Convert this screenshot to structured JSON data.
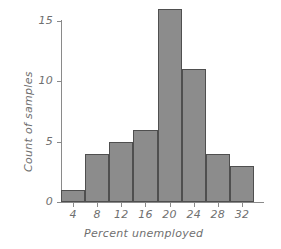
{
  "chart_data": {
    "type": "bar",
    "title": "",
    "subtitle": "",
    "xlabel": "Percent unemployed",
    "ylabel": "Count of samples",
    "categories": [
      "2-6",
      "6-10",
      "10-14",
      "14-18",
      "18-22",
      "22-26",
      "26-30",
      "30-34"
    ],
    "bin_edges": [
      2,
      6,
      10,
      14,
      18,
      22,
      26,
      30,
      34
    ],
    "values": [
      1,
      4,
      5,
      6,
      16,
      11,
      4,
      3
    ],
    "x_tick_labels": [
      "4",
      "8",
      "12",
      "16",
      "20",
      "24",
      "28",
      "32"
    ],
    "x_tick_values": [
      4,
      8,
      12,
      16,
      20,
      24,
      28,
      32
    ],
    "y_tick_labels": [
      "0",
      "5",
      "10",
      "15"
    ],
    "y_tick_values": [
      0,
      5,
      10,
      15
    ],
    "ylim": [
      0,
      16.8
    ],
    "xlim": [
      2,
      34
    ],
    "grid": false,
    "legend": false,
    "bar_fill_color": "#8c8c8c",
    "bar_edge_color": "#4f4f4f",
    "axis_color": "#8a8a8a",
    "text_color": "#6f6f6f",
    "background_color": "#ffffff"
  }
}
